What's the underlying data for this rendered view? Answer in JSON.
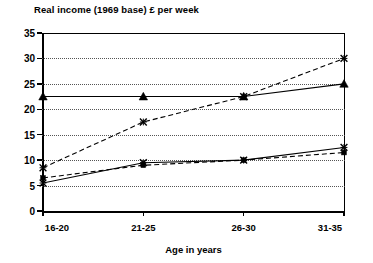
{
  "chart_data": {
    "type": "line",
    "title": "Real income (1969 base) £ per week",
    "xlabel": "Age in years",
    "ylabel": "",
    "categories": [
      "16-20",
      "21-25",
      "26-30",
      "31-35"
    ],
    "ylim": [
      0,
      35
    ],
    "ytick_labels": [
      "0",
      "5",
      "10",
      "15",
      "20",
      "25",
      "30",
      "35"
    ],
    "ytick_values": [
      0,
      5,
      10,
      15,
      20,
      25,
      30,
      35
    ],
    "grid": true,
    "legend": "none",
    "series": [
      {
        "name": "series-triangle-solid",
        "marker": "triangle",
        "line_style": "solid",
        "color": "#000000",
        "values": [
          22.5,
          22.5,
          22.5,
          25.0
        ]
      },
      {
        "name": "series-cross-dashed",
        "marker": "cross",
        "line_style": "dashed",
        "color": "#000000",
        "values": [
          8.5,
          17.5,
          22.5,
          30.0
        ]
      },
      {
        "name": "series-cross-solid",
        "marker": "cross",
        "line_style": "solid",
        "color": "#000000",
        "values": [
          5.5,
          9.5,
          10.0,
          12.5
        ]
      },
      {
        "name": "series-dot-dashed",
        "marker": "dot",
        "line_style": "dashed",
        "color": "#000000",
        "values": [
          6.5,
          9.0,
          10.0,
          11.5
        ]
      }
    ]
  },
  "axis": {
    "y_labels": [
      "35",
      "30",
      "25",
      "20",
      "15",
      "10",
      "5",
      "0"
    ],
    "x_labels": [
      "16-20",
      "21-25",
      "26-30",
      "31-35"
    ],
    "x_title": "Age in years"
  },
  "title": "Real income (1969 base) £ per week"
}
